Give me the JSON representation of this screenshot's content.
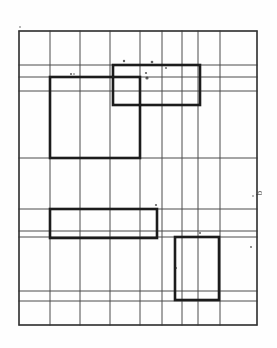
{
  "figure": {
    "kind": "scanned-grid-drawing",
    "caption_mark": "b",
    "background_color": "#fefefe",
    "grid_line_color": "#4a4a4a",
    "heavy_line_color": "#1a1a1a",
    "border": {
      "x1": 19,
      "y1": 31,
      "x2": 257,
      "y2": 325
    },
    "grid": {
      "vertical_x": [
        19,
        50,
        80,
        110,
        140,
        162,
        182,
        198,
        220,
        257
      ],
      "horizontal_y": [
        31,
        65,
        77,
        91,
        158,
        209,
        231,
        237,
        291,
        301,
        325
      ],
      "thin_stroke_width": 1.0,
      "border_stroke_width": 1.4,
      "columns": 9,
      "rows": 10
    },
    "heavy_rectangles": [
      {
        "name": "upper-wide-room",
        "x": 113,
        "y": 65,
        "w": 87,
        "h": 40,
        "stroke": 2.6
      },
      {
        "name": "tall-left-room",
        "x": 50,
        "y": 77,
        "w": 90,
        "h": 81,
        "stroke": 2.6
      },
      {
        "name": "middle-wide-room",
        "x": 50,
        "y": 209,
        "w": 107,
        "h": 29,
        "stroke": 2.6
      },
      {
        "name": "lower-right-room",
        "x": 175,
        "y": 237,
        "w": 44,
        "h": 63,
        "stroke": 2.6
      }
    ],
    "speckles": [
      {
        "x": 152,
        "y": 62,
        "r": 1.3
      },
      {
        "x": 146,
        "y": 73,
        "r": 1.1
      },
      {
        "x": 147,
        "y": 78,
        "r": 1.6
      },
      {
        "x": 71,
        "y": 74,
        "r": 1.0
      },
      {
        "x": 74,
        "y": 74,
        "r": 0.8
      },
      {
        "x": 166,
        "y": 68,
        "r": 0.9
      },
      {
        "x": 124,
        "y": 61,
        "r": 1.2
      },
      {
        "x": 156,
        "y": 205,
        "r": 1.1
      },
      {
        "x": 176,
        "y": 268,
        "r": 1.0
      },
      {
        "x": 251,
        "y": 247,
        "r": 0.9
      },
      {
        "x": 200,
        "y": 233,
        "r": 1.0
      },
      {
        "x": 20,
        "y": 27,
        "r": 0.8
      },
      {
        "x": 253,
        "y": 196,
        "r": 0.8
      }
    ]
  },
  "margin_label": {
    "text": "b",
    "x": 262,
    "y": 194
  }
}
